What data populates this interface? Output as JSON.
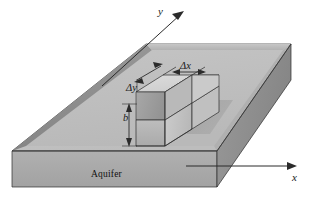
{
  "figure": {
    "axes": {
      "y_label": "y",
      "x_label": "x"
    },
    "dimensions": {
      "delta_x": "Δx",
      "delta_y": "Δy",
      "thickness": "b"
    },
    "region_label": "Aquifer",
    "colors": {
      "background": "#ffffff",
      "slab_top": "#c9c9c9",
      "slab_front": "#a9a9a9",
      "slab_right": "#8f8f8f",
      "inner_wall_left": "#8d8d8d",
      "inner_wall_back": "#bdbdbd",
      "cube_top": "#d6d6d6",
      "cube_left": "#c2c2c2",
      "cube_front": "#b4b4b4",
      "cube_inner": "#9e9e9e",
      "shadow": "#9a9a9a",
      "outline": "#2b2b2b",
      "text": "#1a1a1a"
    },
    "icons": {
      "y_axis_arrow": "arrow-up-right-icon",
      "x_axis_arrow": "arrow-right-icon",
      "delta_x_arrow": "double-arrow-horizontal-icon",
      "delta_y_arrow": "double-arrow-diagonal-icon",
      "b_arrow": "double-arrow-vertical-icon"
    }
  }
}
